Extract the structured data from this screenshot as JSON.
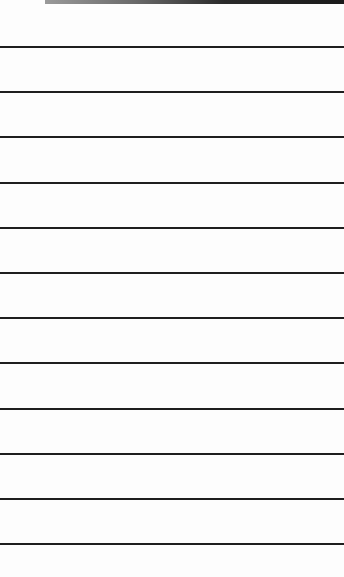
{
  "page": {
    "background": "#fdfdfd",
    "line_color": "#1e1e1e",
    "line_count": 12,
    "line_positions": [
      46,
      91,
      136,
      182,
      227,
      272,
      317,
      362,
      408,
      453,
      498,
      543
    ]
  }
}
